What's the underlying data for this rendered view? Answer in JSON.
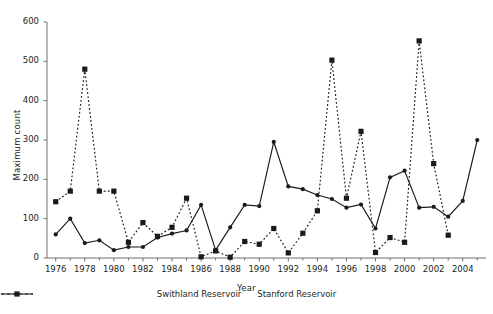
{
  "chart_data": {
    "type": "line",
    "title": "",
    "xlabel": "Year",
    "ylabel": "Maximum count",
    "xlim": [
      1975.4,
      2005.6
    ],
    "ylim": [
      0,
      600
    ],
    "ytick_labels": [
      "0",
      "100",
      "200",
      "300",
      "400",
      "500",
      "600"
    ],
    "yticks": [
      0,
      100,
      200,
      300,
      400,
      500,
      600
    ],
    "xtick_labels": [
      "1976",
      "1978",
      "1980",
      "1982",
      "1984",
      "1986",
      "1988",
      "1990",
      "1992",
      "1994",
      "1996",
      "1998",
      "2000",
      "2002",
      "2004"
    ],
    "xticks_major": [
      1976,
      1978,
      1980,
      1982,
      1984,
      1986,
      1988,
      1990,
      1992,
      1994,
      1996,
      1998,
      2000,
      2002,
      2004
    ],
    "xticks_minor": [
      1977,
      1979,
      1981,
      1983,
      1985,
      1987,
      1989,
      1991,
      1993,
      1995,
      1997,
      1999,
      2001,
      2003,
      2005
    ],
    "grid": false,
    "legend_position": "bottom-center",
    "x": [
      1976,
      1977,
      1978,
      1979,
      1980,
      1981,
      1982,
      1983,
      1984,
      1985,
      1986,
      1987,
      1988,
      1989,
      1990,
      1991,
      1992,
      1993,
      1994,
      1995,
      1996,
      1997,
      1998,
      1999,
      2000,
      2001,
      2002,
      2003,
      2004,
      2005
    ],
    "series": [
      {
        "name": "Swithland Reservoir",
        "line_style": "solid",
        "marker": "circle",
        "color": "#1a1a1a",
        "values": [
          60,
          100,
          38,
          45,
          20,
          28,
          28,
          52,
          62,
          70,
          135,
          20,
          78,
          135,
          132,
          295,
          182,
          175,
          160,
          150,
          128,
          136,
          75,
          205,
          222,
          128,
          130,
          105,
          145,
          300
        ]
      },
      {
        "name": "Stanford Reservoir",
        "line_style": "dashed",
        "marker": "square",
        "color": "#1a1a1a",
        "values": [
          143,
          170,
          480,
          170,
          170,
          40,
          90,
          55,
          78,
          152,
          3,
          18,
          2,
          42,
          35,
          75,
          13,
          63,
          120,
          503,
          152,
          322,
          14,
          52,
          40,
          552,
          240,
          58,
          null,
          null
        ]
      }
    ]
  },
  "legend": {
    "items": [
      {
        "label": "Swithland Reservoir",
        "style": "solid-circle"
      },
      {
        "label": "Stanford Reservoir",
        "style": "dashed-square"
      }
    ]
  },
  "axes": {
    "x_title": "Year",
    "y_title": "Maximum count"
  }
}
